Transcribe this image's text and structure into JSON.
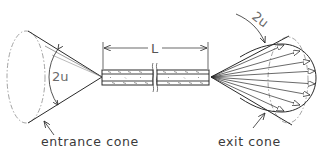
{
  "diagram": {
    "labels": {
      "entrance_cone": "entrance cone",
      "exit_cone": "exit cone",
      "entrance_angle": "2u",
      "exit_angle": "2u",
      "length": "L"
    },
    "colors": {
      "line": "#2a2a2a",
      "dashed": "#9a9a9a",
      "background": "#ffffff"
    },
    "components": [
      {
        "id": "entrance-cone",
        "description": "cone of accepted rays converging on fiber input, full angle 2u"
      },
      {
        "id": "fiber",
        "description": "clad fiber of length L, shown with a break"
      },
      {
        "id": "exit-cone",
        "description": "cone of emerging rays diverging from fiber output, full angle 2u, with ray arrows"
      }
    ]
  }
}
